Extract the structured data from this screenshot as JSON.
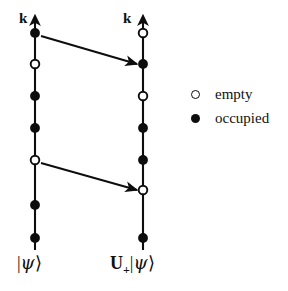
{
  "figure": {
    "width": 288,
    "height": 291,
    "background": "#ffffff",
    "ink": "#0d0d0d"
  },
  "axes": [
    {
      "id": "left-axis",
      "name": "initial-state-axis",
      "axis_label": "k",
      "state_label_op": "",
      "state_label_sub": "",
      "state_label_ket_open": "|",
      "state_label_psi": "ψ",
      "state_label_ket_close": "⟩",
      "x": 35,
      "top_y": 20,
      "bottom_y": 250,
      "markers": [
        {
          "index": 1,
          "y": 33,
          "state": "occupied"
        },
        {
          "index": 2,
          "y": 64,
          "state": "empty"
        },
        {
          "index": 3,
          "y": 96,
          "state": "occupied"
        },
        {
          "index": 4,
          "y": 128,
          "state": "occupied"
        },
        {
          "index": 5,
          "y": 160,
          "state": "empty"
        },
        {
          "index": 6,
          "y": 205,
          "state": "occupied"
        },
        {
          "index": 7,
          "y": 238,
          "state": "occupied"
        }
      ]
    },
    {
      "id": "right-axis",
      "name": "transformed-state-axis",
      "axis_label": "k",
      "state_label_op": "U",
      "state_label_sub": "+",
      "state_label_ket_open": "|",
      "state_label_psi": "ψ",
      "state_label_ket_close": "⟩",
      "x": 143,
      "top_y": 20,
      "bottom_y": 250,
      "markers": [
        {
          "index": 1,
          "y": 33,
          "state": "empty"
        },
        {
          "index": 2,
          "y": 64,
          "state": "occupied"
        },
        {
          "index": 3,
          "y": 96,
          "state": "empty"
        },
        {
          "index": 4,
          "y": 128,
          "state": "occupied"
        },
        {
          "index": 5,
          "y": 160,
          "state": "occupied"
        },
        {
          "index": 6,
          "y": 190,
          "state": "empty"
        },
        {
          "index": 7,
          "y": 238,
          "state": "occupied"
        }
      ]
    }
  ],
  "arrows": [
    {
      "id": "arrow-1",
      "from_x": 41,
      "from_y": 36,
      "to_x": 137,
      "to_y": 64
    },
    {
      "id": "arrow-2",
      "from_x": 41,
      "from_y": 163,
      "to_x": 137,
      "to_y": 190
    }
  ],
  "legend": {
    "items": [
      {
        "marker": "empty",
        "label": "empty"
      },
      {
        "marker": "occupied",
        "label": "occupied"
      }
    ]
  },
  "labels": {
    "left_axis_k": "k",
    "right_axis_k": "k"
  }
}
